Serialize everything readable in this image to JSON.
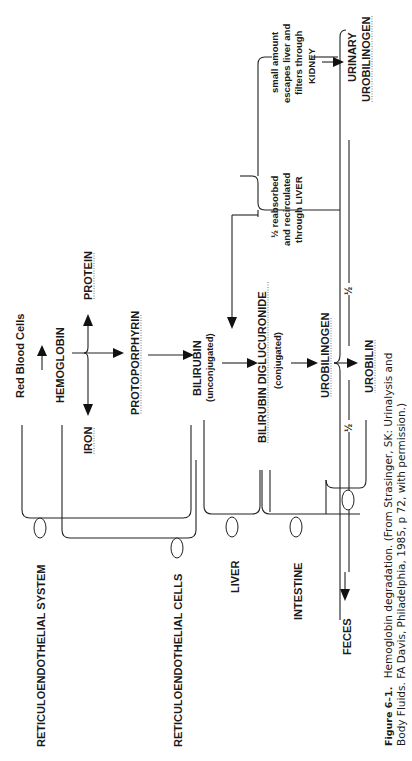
{
  "diagram": {
    "title": "Hemoglobin degradation",
    "orientation": "rotated-90-ccw",
    "nodes": {
      "red_blood_cells": "Red Blood Cells",
      "hemoglobin": "HEMOGLOBIN",
      "protein": "PROTEIN",
      "iron": "IRON",
      "protoporphyrin": "PROTOPORPHYRIN",
      "bilirubin": "BILIRUBIN",
      "bilirubin_note": "(unconjugated)",
      "bilirubin_diglucuronide": "BILIRUBIN DIGLUCURONIDE",
      "bilirubin_diglucuronide_note": "(conjugated)",
      "urobilinogen": "UROBILINOGEN",
      "urobilin": "UROBILIN",
      "half_left": "½",
      "half_right": "½",
      "reabsorbed_line1": "½ reabsorbed",
      "reabsorbed_line2": "and recirculated",
      "reabsorbed_line3": "through LIVER",
      "escape_line1": "small amount",
      "escape_line2": "escapes liver and",
      "escape_line3": "filters through",
      "escape_line4": "KIDNEY",
      "urinary_line1": "URINARY",
      "urinary_line2": "UROBILINOGEN",
      "feces": "FECES"
    },
    "regions": {
      "reticuloendothelial_system": "RETICULOENDOTHELIAL SYSTEM",
      "reticuloendothelial_cells": "RETICULOENDOTHELIAL CELLS",
      "liver": "LIVER",
      "intestine": "INTESTINE"
    },
    "caption": {
      "label": "Figure 6–1.",
      "line1": "Hemoglobin degradation. (From Strasinger, SK: Urinalysis and",
      "line2": "Body Fluids. FA Davis, Philadelphia, 1985, p 72, with permission.)"
    }
  }
}
